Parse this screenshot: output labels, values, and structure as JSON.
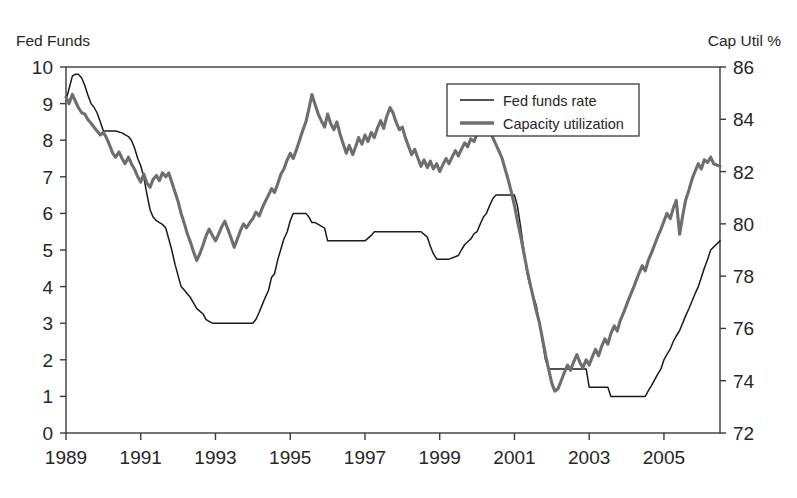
{
  "chart_data": {
    "type": "line",
    "title": "",
    "xlabel": "",
    "ylabel": "Fed Funds",
    "y2label": "Cap Util %",
    "grid": false,
    "legend_position": "top-right",
    "xlim": [
      1989.0,
      2006.5
    ],
    "ylim": [
      0,
      10
    ],
    "y2lim": [
      72,
      86
    ],
    "x_ticks": [
      1989,
      1991,
      1993,
      1995,
      1997,
      1999,
      2001,
      2003,
      2005
    ],
    "x_tick_labels": [
      "1989",
      "1991",
      "1993",
      "1995",
      "1997",
      "1999",
      "2001",
      "2003",
      "2005"
    ],
    "x_minor_ticks": [
      1990,
      1992,
      1994,
      1996,
      1998,
      2000,
      2002,
      2004,
      2006
    ],
    "y_ticks": [
      0,
      1,
      2,
      3,
      4,
      5,
      6,
      7,
      8,
      9,
      10
    ],
    "y_tick_labels": [
      "0",
      "1",
      "2",
      "3",
      "4",
      "5",
      "6",
      "7",
      "8",
      "9",
      "10"
    ],
    "y2_ticks": [
      72,
      74,
      76,
      78,
      80,
      82,
      84,
      86
    ],
    "y2_tick_labels": [
      "72",
      "74",
      "76",
      "78",
      "80",
      "82",
      "84",
      "86"
    ],
    "series": [
      {
        "name": "Fed funds rate",
        "axis": "left",
        "color": "#1a1a1a",
        "style": "thin-line",
        "legend_label": "Fed funds rate",
        "x": [
          1989.0,
          1989.08,
          1989.17,
          1989.25,
          1989.33,
          1989.42,
          1989.5,
          1989.58,
          1989.67,
          1989.75,
          1989.83,
          1989.92,
          1990.0,
          1990.17,
          1990.33,
          1990.5,
          1990.58,
          1990.67,
          1990.75,
          1990.83,
          1990.92,
          1991.0,
          1991.08,
          1991.17,
          1991.25,
          1991.33,
          1991.42,
          1991.5,
          1991.58,
          1991.67,
          1991.75,
          1991.83,
          1991.92,
          1992.0,
          1992.08,
          1992.17,
          1992.25,
          1992.33,
          1992.5,
          1992.67,
          1992.75,
          1992.83,
          1992.92,
          1993.0,
          1993.5,
          1994.0,
          1994.08,
          1994.17,
          1994.25,
          1994.33,
          1994.42,
          1994.5,
          1994.58,
          1994.67,
          1994.83,
          1994.92,
          1995.0,
          1995.08,
          1995.17,
          1995.25,
          1995.42,
          1995.5,
          1995.58,
          1995.67,
          1995.92,
          1996.0,
          1996.08,
          1996.17,
          1996.25,
          1996.5,
          1996.75,
          1997.0,
          1997.17,
          1997.25,
          1997.5,
          1997.75,
          1998.0,
          1998.25,
          1998.5,
          1998.67,
          1998.75,
          1998.83,
          1998.92,
          1999.0,
          1999.25,
          1999.5,
          1999.58,
          1999.67,
          1999.83,
          1999.92,
          2000.0,
          2000.08,
          2000.17,
          2000.25,
          2000.33,
          2000.42,
          2000.5,
          2000.75,
          2000.92,
          2001.0,
          2001.08,
          2001.17,
          2001.25,
          2001.33,
          2001.42,
          2001.5,
          2001.58,
          2001.67,
          2001.75,
          2001.83,
          2001.92,
          2002.0,
          2002.5,
          2002.92,
          2003.0,
          2003.25,
          2003.5,
          2003.58,
          2003.75,
          2004.0,
          2004.25,
          2004.5,
          2004.58,
          2004.67,
          2004.75,
          2004.83,
          2004.92,
          2005.0,
          2005.08,
          2005.17,
          2005.25,
          2005.33,
          2005.42,
          2005.5,
          2005.58,
          2005.67,
          2005.75,
          2005.83,
          2005.92,
          2006.0,
          2006.08,
          2006.17,
          2006.25,
          2006.5
        ],
        "y": [
          9.1,
          9.4,
          9.75,
          9.8,
          9.8,
          9.7,
          9.5,
          9.25,
          9.0,
          8.9,
          8.75,
          8.5,
          8.25,
          8.25,
          8.25,
          8.2,
          8.15,
          8.1,
          8.0,
          7.8,
          7.5,
          7.3,
          7.0,
          6.5,
          6.1,
          5.9,
          5.8,
          5.75,
          5.7,
          5.6,
          5.3,
          5.0,
          4.6,
          4.3,
          4.0,
          3.9,
          3.8,
          3.7,
          3.4,
          3.25,
          3.1,
          3.05,
          3.0,
          3.0,
          3.0,
          3.0,
          3.1,
          3.3,
          3.5,
          3.7,
          3.9,
          4.25,
          4.35,
          4.75,
          5.3,
          5.5,
          5.8,
          6.0,
          6.0,
          6.0,
          6.0,
          5.9,
          5.75,
          5.75,
          5.6,
          5.25,
          5.25,
          5.25,
          5.25,
          5.25,
          5.25,
          5.25,
          5.4,
          5.5,
          5.5,
          5.5,
          5.5,
          5.5,
          5.5,
          5.35,
          5.1,
          4.9,
          4.75,
          4.75,
          4.75,
          4.85,
          5.0,
          5.15,
          5.3,
          5.45,
          5.5,
          5.7,
          5.9,
          6.0,
          6.2,
          6.4,
          6.5,
          6.5,
          6.5,
          6.5,
          6.2,
          5.6,
          5.0,
          4.4,
          4.0,
          3.75,
          3.5,
          3.0,
          2.5,
          2.0,
          1.75,
          1.75,
          1.75,
          1.75,
          1.25,
          1.25,
          1.25,
          1.0,
          1.0,
          1.0,
          1.0,
          1.0,
          1.15,
          1.3,
          1.45,
          1.6,
          1.75,
          2.0,
          2.15,
          2.3,
          2.5,
          2.65,
          2.8,
          3.0,
          3.2,
          3.4,
          3.6,
          3.8,
          4.0,
          4.25,
          4.5,
          4.75,
          5.0,
          5.25
        ]
      },
      {
        "name": "Capacity utilization",
        "axis": "right",
        "color": "#6e6e6e",
        "style": "thick-line",
        "legend_label": "Capacity utilization",
        "x": [
          1989.0,
          1989.08,
          1989.17,
          1989.25,
          1989.33,
          1989.42,
          1989.5,
          1989.58,
          1989.67,
          1989.75,
          1989.83,
          1989.92,
          1990.0,
          1990.08,
          1990.17,
          1990.25,
          1990.33,
          1990.42,
          1990.5,
          1990.58,
          1990.67,
          1990.75,
          1990.83,
          1990.92,
          1991.0,
          1991.08,
          1991.17,
          1991.25,
          1991.33,
          1991.42,
          1991.5,
          1991.58,
          1991.67,
          1991.75,
          1991.83,
          1991.92,
          1992.0,
          1992.08,
          1992.17,
          1992.25,
          1992.33,
          1992.42,
          1992.5,
          1992.58,
          1992.67,
          1992.75,
          1992.83,
          1992.92,
          1993.0,
          1993.08,
          1993.17,
          1993.25,
          1993.33,
          1993.42,
          1993.5,
          1993.58,
          1993.67,
          1993.75,
          1993.83,
          1993.92,
          1994.0,
          1994.08,
          1994.17,
          1994.25,
          1994.33,
          1994.42,
          1994.5,
          1994.58,
          1994.67,
          1994.75,
          1994.83,
          1994.92,
          1995.0,
          1995.08,
          1995.17,
          1995.25,
          1995.33,
          1995.42,
          1995.5,
          1995.58,
          1995.67,
          1995.75,
          1995.83,
          1995.92,
          1996.0,
          1996.08,
          1996.17,
          1996.25,
          1996.33,
          1996.42,
          1996.5,
          1996.58,
          1996.67,
          1996.75,
          1996.83,
          1996.92,
          1997.0,
          1997.08,
          1997.17,
          1997.25,
          1997.33,
          1997.42,
          1997.5,
          1997.58,
          1997.67,
          1997.75,
          1997.83,
          1997.92,
          1998.0,
          1998.08,
          1998.17,
          1998.25,
          1998.33,
          1998.42,
          1998.5,
          1998.58,
          1998.67,
          1998.75,
          1998.83,
          1998.92,
          1999.0,
          1999.08,
          1999.17,
          1999.25,
          1999.33,
          1999.42,
          1999.5,
          1999.58,
          1999.67,
          1999.75,
          1999.83,
          1999.92,
          2000.0,
          2000.08,
          2000.17,
          2000.25,
          2000.33,
          2000.42,
          2000.5,
          2000.58,
          2000.67,
          2000.75,
          2000.83,
          2000.92,
          2001.0,
          2001.08,
          2001.17,
          2001.25,
          2001.33,
          2001.42,
          2001.5,
          2001.58,
          2001.67,
          2001.75,
          2001.83,
          2001.92,
          2002.0,
          2002.08,
          2002.17,
          2002.25,
          2002.33,
          2002.42,
          2002.5,
          2002.58,
          2002.67,
          2002.75,
          2002.83,
          2002.92,
          2003.0,
          2003.08,
          2003.17,
          2003.25,
          2003.33,
          2003.42,
          2003.5,
          2003.58,
          2003.67,
          2003.75,
          2003.83,
          2003.92,
          2004.0,
          2004.08,
          2004.17,
          2004.25,
          2004.33,
          2004.42,
          2004.5,
          2004.58,
          2004.67,
          2004.75,
          2004.83,
          2004.92,
          2005.0,
          2005.08,
          2005.17,
          2005.25,
          2005.33,
          2005.42,
          2005.5,
          2005.58,
          2005.67,
          2005.75,
          2005.83,
          2005.92,
          2006.0,
          2006.08,
          2006.17,
          2006.25,
          2006.33,
          2006.5
        ],
        "y": [
          84.85,
          84.6,
          84.95,
          84.7,
          84.45,
          84.25,
          84.2,
          84.0,
          83.85,
          83.7,
          83.55,
          83.4,
          83.5,
          83.3,
          83.0,
          82.7,
          82.55,
          82.75,
          82.5,
          82.3,
          82.55,
          82.3,
          82.1,
          81.8,
          81.6,
          81.9,
          81.55,
          81.4,
          81.7,
          81.85,
          81.65,
          81.95,
          81.8,
          81.95,
          81.6,
          81.2,
          80.85,
          80.4,
          80.0,
          79.6,
          79.3,
          78.9,
          78.6,
          78.85,
          79.2,
          79.55,
          79.8,
          79.55,
          79.35,
          79.6,
          79.9,
          80.1,
          79.8,
          79.45,
          79.1,
          79.4,
          79.75,
          80.0,
          79.85,
          80.05,
          80.2,
          80.45,
          80.3,
          80.6,
          80.85,
          81.1,
          81.35,
          81.2,
          81.55,
          81.9,
          82.1,
          82.45,
          82.7,
          82.5,
          82.85,
          83.2,
          83.55,
          83.9,
          84.4,
          84.95,
          84.55,
          84.2,
          83.95,
          83.7,
          84.2,
          83.85,
          83.6,
          83.9,
          83.45,
          83.05,
          82.7,
          83.0,
          82.65,
          82.95,
          83.3,
          83.05,
          83.4,
          83.15,
          83.5,
          83.3,
          83.65,
          83.95,
          83.65,
          84.1,
          84.45,
          84.25,
          83.9,
          83.6,
          83.7,
          83.3,
          82.95,
          82.65,
          82.85,
          82.5,
          82.2,
          82.45,
          82.15,
          82.4,
          82.1,
          82.3,
          82.0,
          82.25,
          82.5,
          82.3,
          82.55,
          82.8,
          82.6,
          82.85,
          83.1,
          82.95,
          83.25,
          83.15,
          83.45,
          83.7,
          83.5,
          83.75,
          83.55,
          83.3,
          83.05,
          82.8,
          82.5,
          82.1,
          81.7,
          81.2,
          80.7,
          80.1,
          79.5,
          78.9,
          78.3,
          77.7,
          77.2,
          76.7,
          76.2,
          75.6,
          75.0,
          74.4,
          73.9,
          73.6,
          73.7,
          74.0,
          74.3,
          74.6,
          74.4,
          74.7,
          75.0,
          74.7,
          74.5,
          74.8,
          74.6,
          74.9,
          75.2,
          74.95,
          75.3,
          75.6,
          75.4,
          75.8,
          76.1,
          75.9,
          76.3,
          76.6,
          76.9,
          77.2,
          77.5,
          77.8,
          78.1,
          78.4,
          78.2,
          78.6,
          78.9,
          79.2,
          79.5,
          79.8,
          80.1,
          80.4,
          80.2,
          80.6,
          80.9,
          79.6,
          80.3,
          80.9,
          81.3,
          81.7,
          82.0,
          82.3,
          82.1,
          82.45,
          82.35,
          82.55,
          82.3,
          82.2
        ]
      }
    ]
  },
  "legend": {
    "items": [
      {
        "label": "Fed funds rate",
        "color": "#1a1a1a",
        "style": "thin"
      },
      {
        "label": "Capacity utilization",
        "color": "#6e6e6e",
        "style": "thick"
      }
    ]
  },
  "labels": {
    "left_axis_title": "Fed Funds",
    "right_axis_title": "Cap Util %"
  }
}
